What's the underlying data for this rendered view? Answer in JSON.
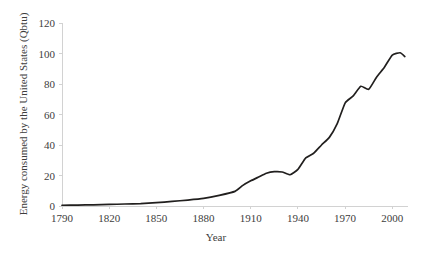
{
  "chart_data": {
    "type": "line",
    "title": "",
    "xlabel": "Year",
    "ylabel": "Energy consumed by the United States (Qbtu)",
    "xlim": [
      1790,
      2010
    ],
    "ylim": [
      0,
      120
    ],
    "xticks": [
      1790,
      1820,
      1850,
      1880,
      1910,
      1940,
      1970,
      2000
    ],
    "yticks": [
      0,
      20,
      40,
      60,
      80,
      100,
      120
    ],
    "grid": false,
    "legend": "none",
    "series": [
      {
        "name": "Energy consumed by the United States",
        "x": [
          1790,
          1800,
          1810,
          1820,
          1830,
          1840,
          1850,
          1860,
          1870,
          1880,
          1890,
          1900,
          1905,
          1910,
          1915,
          1920,
          1925,
          1930,
          1935,
          1940,
          1945,
          1950,
          1955,
          1960,
          1965,
          1970,
          1975,
          1980,
          1985,
          1990,
          1995,
          2000,
          2005,
          2008
        ],
        "y": [
          0.5,
          0.6,
          0.8,
          1.0,
          1.3,
          1.6,
          2.2,
          3.0,
          3.9,
          5.0,
          7.0,
          9.6,
          13.5,
          16.5,
          19.0,
          21.5,
          22.5,
          22.3,
          20.5,
          24.0,
          31.5,
          34.6,
          40.0,
          45.0,
          54.0,
          67.5,
          72.0,
          78.5,
          76.5,
          84.5,
          91.0,
          99.0,
          100.5,
          98.0
        ]
      }
    ]
  },
  "axis_labels": {
    "x_ticks": [
      "1790",
      "1820",
      "1850",
      "1880",
      "1910",
      "1940",
      "1970",
      "2000"
    ],
    "y_ticks": [
      "0",
      "20",
      "40",
      "60",
      "80",
      "100",
      "120"
    ],
    "x_title": "Year",
    "y_title": "Energy consumed by the United States (Qbtu)"
  },
  "colors": {
    "line": "#211f1e",
    "axis": "#d2d2d2",
    "text": "#3d3d3d",
    "background": "#ffffff"
  }
}
